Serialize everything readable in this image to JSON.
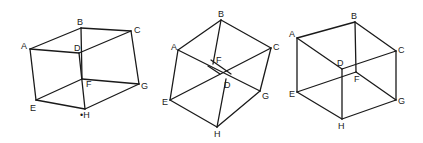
{
  "figure": {
    "cubes": [
      {
        "id": "cube-1",
        "vertices": {
          "A": [
            30,
            49
          ],
          "B": [
            81,
            28
          ],
          "C": [
            131,
            31
          ],
          "D": [
            79,
            53
          ],
          "E": [
            36,
            100
          ],
          "F": [
            82,
            79
          ],
          "G": [
            139,
            84
          ],
          "H": [
            85,
            109
          ]
        },
        "labels": {
          "A": {
            "text": "A",
            "pos": [
              21,
              49
            ]
          },
          "B": {
            "text": "B",
            "pos": [
              77,
              25
            ]
          },
          "C": {
            "text": "C",
            "pos": [
              134,
              33
            ]
          },
          "D": {
            "text": "D",
            "pos": [
              74,
              51
            ]
          },
          "E": {
            "text": "E",
            "pos": [
              30,
              111
            ]
          },
          "F": {
            "text": "F",
            "pos": [
              86,
              87
            ]
          },
          "G": {
            "text": "G",
            "pos": [
              141,
              89
            ]
          },
          "H": {
            "text": "•H",
            "pos": [
              80,
              118
            ]
          }
        },
        "edges": [
          [
            "A",
            "B"
          ],
          [
            "B",
            "C"
          ],
          [
            "A",
            "D"
          ],
          [
            "D",
            "C"
          ],
          [
            "B",
            "F"
          ],
          [
            "D",
            "H"
          ],
          [
            "A",
            "E"
          ],
          [
            "C",
            "G"
          ],
          [
            "E",
            "H"
          ],
          [
            "H",
            "G"
          ],
          [
            "E",
            "F"
          ],
          [
            "F",
            "G"
          ]
        ]
      },
      {
        "id": "cube-2",
        "vertices": {
          "A": [
            178,
            50
          ],
          "B": [
            221,
            20
          ],
          "C": [
            271,
            48
          ],
          "D": [
            226,
            79
          ],
          "E": [
            170,
            100
          ],
          "F": [
            213,
            64
          ],
          "G": [
            260,
            91
          ],
          "H": [
            217,
            127
          ]
        },
        "labels": {
          "A": {
            "text": "A",
            "pos": [
              171,
              50
            ]
          },
          "B": {
            "text": "B",
            "pos": [
              218,
              17
            ]
          },
          "C": {
            "text": "C",
            "pos": [
              273,
              50
            ]
          },
          "D": {
            "text": "D",
            "pos": [
              224,
              88
            ]
          },
          "E": {
            "text": "E",
            "pos": [
              162,
              105
            ]
          },
          "F": {
            "text": "F",
            "pos": [
              216,
              63
            ]
          },
          "G": {
            "text": "G",
            "pos": [
              262,
              99
            ]
          },
          "H": {
            "text": "H",
            "pos": [
              214,
              137
            ]
          }
        },
        "edges": [
          [
            "A",
            "B"
          ],
          [
            "B",
            "C"
          ],
          [
            "A",
            "E"
          ],
          [
            "C",
            "G"
          ],
          [
            "E",
            "H"
          ],
          [
            "H",
            "G"
          ],
          [
            "A",
            "G"
          ],
          [
            "E",
            "C"
          ],
          [
            "B",
            "F"
          ],
          [
            "H",
            "D"
          ]
        ]
      },
      {
        "id": "cube-3",
        "vertices": {
          "A": [
            297,
            38
          ],
          "B": [
            355,
            22
          ],
          "C": [
            396,
            51
          ],
          "D": [
            342,
            69
          ],
          "E": [
            297,
            92
          ],
          "F": [
            356,
            72
          ],
          "G": [
            396,
            100
          ],
          "H": [
            342,
            119
          ]
        },
        "labels": {
          "A": {
            "text": "A",
            "pos": [
              289,
              37
            ]
          },
          "B": {
            "text": "B",
            "pos": [
              351,
              19
            ]
          },
          "C": {
            "text": "C",
            "pos": [
              398,
              53
            ]
          },
          "D": {
            "text": "D",
            "pos": [
              337,
              66
            ]
          },
          "E": {
            "text": "E",
            "pos": [
              289,
              97
            ]
          },
          "F": {
            "text": "F",
            "pos": [
              354,
              82
            ]
          },
          "G": {
            "text": "G",
            "pos": [
              398,
              104
            ]
          },
          "H": {
            "text": "H",
            "pos": [
              338,
              129
            ]
          }
        },
        "edges": [
          [
            "A",
            "B"
          ],
          [
            "B",
            "C"
          ],
          [
            "A",
            "D"
          ],
          [
            "D",
            "C"
          ],
          [
            "B",
            "F"
          ],
          [
            "D",
            "H"
          ],
          [
            "A",
            "E"
          ],
          [
            "C",
            "G"
          ],
          [
            "E",
            "H"
          ],
          [
            "H",
            "G"
          ],
          [
            "E",
            "F"
          ],
          [
            "F",
            "G"
          ]
        ]
      }
    ]
  }
}
